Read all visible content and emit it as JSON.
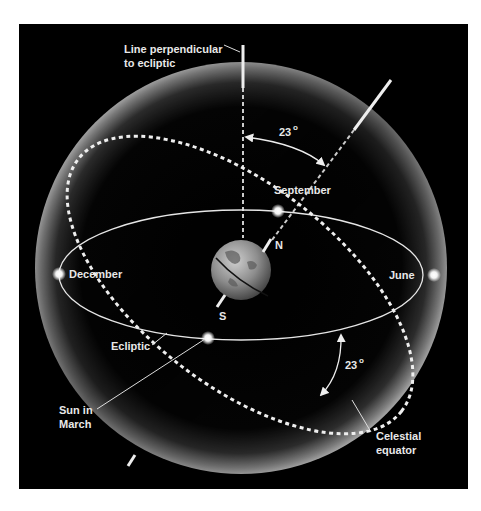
{
  "diagram": {
    "colors": {
      "background": "#000000",
      "page": "#ffffff",
      "lines": "#e6e6e6",
      "labels": "#e8e8e8"
    },
    "labels": {
      "perpendicular_line_1": "Line perpendicular",
      "perpendicular_line_2": "to ecliptic",
      "angle_top": "23",
      "angle_top_unit": "o",
      "september": "September",
      "december": "December",
      "june": "June",
      "north": "N",
      "south": "S",
      "ecliptic": "Ecliptic",
      "sun_in_march_1": "Sun in",
      "sun_in_march_2": "March",
      "angle_bottom": "23",
      "angle_bottom_unit": "o",
      "celestial_equator_1": "Celestial",
      "celestial_equator_2": "equator"
    },
    "tilt_degrees": 23,
    "markers": [
      "December",
      "June",
      "September",
      "March"
    ]
  }
}
